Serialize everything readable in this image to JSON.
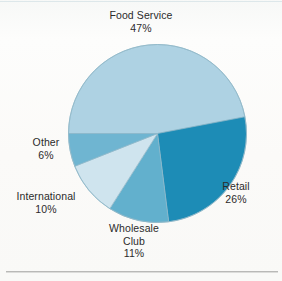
{
  "chart_data": {
    "type": "pie",
    "title": "",
    "labels": [
      "Food Service",
      "Retail",
      "Wholesale Club",
      "International",
      "Other"
    ],
    "values": [
      47,
      26,
      11,
      10,
      6
    ],
    "value_labels": [
      "47%",
      "26%",
      "11%",
      "10%",
      "6%"
    ],
    "units": "percent",
    "legend": "none",
    "labels_position": "outside-callout-free",
    "start_angle_deg": 180,
    "direction": "clockwise",
    "colors": [
      "#aed2e3",
      "#1d8cb6",
      "#62b0cd",
      "#cfe4ee",
      "#6fb5d1"
    ],
    "slices": [
      {
        "label": "Food Service",
        "value": 47,
        "value_label": "47%",
        "color": "#aed2e3"
      },
      {
        "label": "Retail",
        "value": 26,
        "value_label": "26%",
        "color": "#1d8cb6"
      },
      {
        "label": "Wholesale Club",
        "value": 11,
        "value_label": "11%",
        "color": "#62b0cd"
      },
      {
        "label": "International",
        "value": 10,
        "value_label": "10%",
        "color": "#cfe4ee"
      },
      {
        "label": "Other",
        "value": 6,
        "value_label": "6%",
        "color": "#6fb5d1"
      }
    ]
  },
  "labels": {
    "food_service": {
      "name": "Food Service",
      "pct": "47%"
    },
    "retail": {
      "name": "Retail",
      "pct": "26%"
    },
    "wholesale_club": {
      "name1": "Wholesale",
      "name2": "Club",
      "pct": "11%"
    },
    "international": {
      "name": "International",
      "pct": "10%"
    },
    "other": {
      "name": "Other",
      "pct": "6%"
    }
  },
  "style": {
    "page_background": "#fbfbf9",
    "text_color": "#2b2b2b",
    "outline_color": "#8fb8c8",
    "rule_color": "#b9b9b7"
  }
}
